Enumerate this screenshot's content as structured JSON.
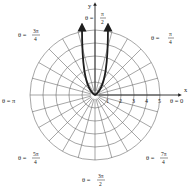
{
  "diagram": {
    "type": "polar-graph",
    "center_px": [
      95,
      95
    ],
    "ring_spacing_px": 13,
    "ring_count": 5,
    "ray_step_degrees": 15,
    "axes": {
      "x_label": "x",
      "y_label": "y"
    },
    "radial_ticks": [
      "1",
      "2",
      "3",
      "4",
      "5"
    ],
    "angle_labels": [
      {
        "id": "theta-0",
        "prefix": "θ = ",
        "num": "0",
        "den": ""
      },
      {
        "id": "theta-pi-4",
        "prefix": "θ = ",
        "num": "π",
        "den": "4"
      },
      {
        "id": "theta-pi-2",
        "prefix": "θ = ",
        "num": "π",
        "den": "2"
      },
      {
        "id": "theta-3pi-4",
        "prefix": "θ = ",
        "num": "3π",
        "den": "4"
      },
      {
        "id": "theta-pi",
        "prefix": "θ = ",
        "num": "π",
        "den": ""
      },
      {
        "id": "theta-5pi-4",
        "prefix": "θ = ",
        "num": "5π",
        "den": "4"
      },
      {
        "id": "theta-3pi-2",
        "prefix": "θ = ",
        "num": "3π",
        "den": "2"
      },
      {
        "id": "theta-7pi-4",
        "prefix": "θ = ",
        "num": "7π",
        "den": "4"
      }
    ],
    "curve": {
      "description": "U-shaped curve through the pole with two branches rising toward θ = π/2, arrows at top",
      "color": "#1e1e1e"
    }
  }
}
